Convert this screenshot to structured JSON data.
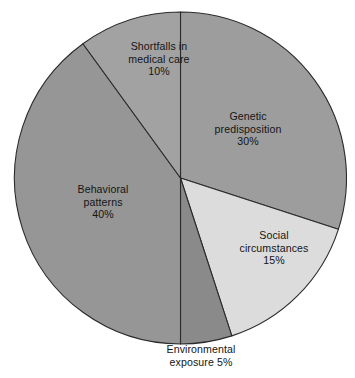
{
  "chart_data": {
    "type": "pie",
    "title": "",
    "subtitle": "",
    "xlabel": "",
    "ylabel": "",
    "legend_position": "none",
    "grid": false,
    "start_angle_deg": 0,
    "direction": "clockwise",
    "categories": [
      "Genetic predisposition",
      "Social circumstances",
      "Environmental exposure",
      "Behavioral patterns",
      "Shortfalls in medical care"
    ],
    "values": [
      30,
      15,
      5,
      40,
      10
    ],
    "value_labels": [
      "30%",
      "15%",
      "5%",
      "40%",
      "10%"
    ],
    "colors": [
      "#9d9d9d",
      "#dcdcdc",
      "#8a8a8a",
      "#969696",
      "#a2a2a2"
    ],
    "slices": [
      {
        "name": "Genetic predisposition",
        "value": 30,
        "value_label": "30%",
        "color": "#9d9d9d",
        "start_deg": 0,
        "end_deg": 108,
        "label_lines": [
          "Genetic",
          "predisposition",
          "30%"
        ]
      },
      {
        "name": "Social circumstances",
        "value": 15,
        "value_label": "15%",
        "color": "#dcdcdc",
        "start_deg": 108,
        "end_deg": 162,
        "label_lines": [
          "Social",
          "circumstances",
          "15%"
        ]
      },
      {
        "name": "Environmental exposure",
        "value": 5,
        "value_label": "5%",
        "color": "#8a8a8a",
        "start_deg": 162,
        "end_deg": 180,
        "label_lines": [
          "Environmental",
          "exposure 5%"
        ]
      },
      {
        "name": "Behavioral patterns",
        "value": 40,
        "value_label": "40%",
        "color": "#969696",
        "start_deg": 180,
        "end_deg": 324,
        "label_lines": [
          "Behavioral",
          "patterns",
          "40%"
        ]
      },
      {
        "name": "Shortfalls in medical care",
        "value": 10,
        "value_label": "10%",
        "color": "#a2a2a2",
        "start_deg": 324,
        "end_deg": 360,
        "label_lines": [
          "Shortfalls in",
          "medical care",
          "10%"
        ]
      }
    ]
  },
  "labels": {
    "genetic": {
      "line1": "Genetic",
      "line2": "predisposition",
      "line3": "30%"
    },
    "social": {
      "line1": "Social",
      "line2": "circumstances",
      "line3": "15%"
    },
    "environmental": {
      "line1": "Environmental",
      "line2": "exposure 5%"
    },
    "behavioral": {
      "line1": "Behavioral",
      "line2": "patterns",
      "line3": "40%"
    },
    "shortfalls": {
      "line1": "Shortfalls in",
      "line2": "medical care",
      "line3": "10%"
    }
  },
  "geometry": {
    "center_x": 180.5,
    "center_y": 178,
    "radius": 166,
    "outline_color": "#2b2b2b"
  }
}
